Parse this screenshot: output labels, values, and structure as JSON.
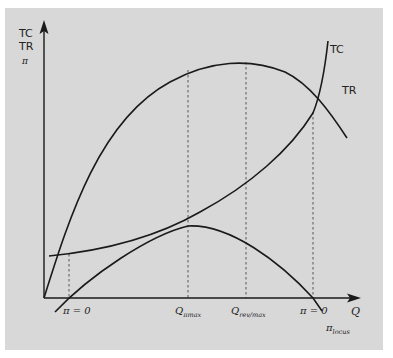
{
  "diagram": {
    "type": "economics-cost-revenue-profit",
    "y_axis": {
      "labels": [
        "TC",
        "TR",
        "π"
      ]
    },
    "x_axis": {
      "label": "Q",
      "ticks": [
        {
          "id": "pi_zero_left",
          "text": "π = 0"
        },
        {
          "id": "q_pimax",
          "main": "Q",
          "sub": "πmax"
        },
        {
          "id": "q_revmax",
          "main": "Q",
          "sub": "rev/max"
        },
        {
          "id": "pi_zero_right",
          "text": "π = 0"
        }
      ]
    },
    "curves": [
      {
        "id": "TC",
        "label": "TC",
        "shape": "convex increasing, positive intercept"
      },
      {
        "id": "TR",
        "label": "TR",
        "shape": "concave hump, peak at Q rev/max"
      },
      {
        "id": "profit",
        "label": "π",
        "shape": "hump, peak at Q πmax, zero at both break-even points"
      }
    ],
    "annotations": [
      {
        "id": "pi_locus",
        "main": "π",
        "sub": "locus"
      }
    ],
    "colors": {
      "background": "#d8d8d8",
      "line": "#222222",
      "dashed": "#555555"
    }
  }
}
